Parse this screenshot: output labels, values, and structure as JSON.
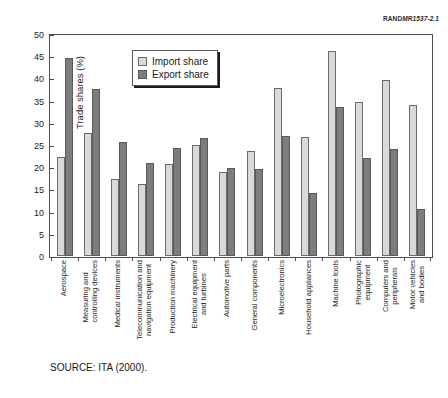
{
  "figure_number": {
    "brand": "RAND",
    "code": "MR1537-2.1"
  },
  "source_note": "SOURCE: ITA (2000).",
  "legend": {
    "position": "inside-top-left",
    "entries": [
      {
        "label": "Import share",
        "color": "#d9d9d9",
        "key": "import"
      },
      {
        "label": "Export share",
        "color": "#7d7d7d",
        "key": "export"
      }
    ]
  },
  "axis": {
    "y_title": "Trade shares (%)",
    "y_ticks": [
      0,
      5,
      10,
      15,
      20,
      25,
      30,
      35,
      40,
      45,
      50
    ]
  },
  "chart_data": {
    "type": "bar",
    "title": "",
    "subtitle": "",
    "xlabel": "",
    "ylabel": "Trade shares (%)",
    "ylim": [
      0,
      50
    ],
    "ytick_step": 5,
    "grid": false,
    "legend_position": "inside-top-left",
    "orientation": "vertical",
    "grouping": "grouped",
    "categories": [
      "Aerospace",
      "Measuring and controlling devices",
      "Medical instruments",
      "Telecommunication and navigation equipment",
      "Production machinery",
      "Electrical equipment and turbines",
      "Automotive parts",
      "General components",
      "Microelectronics",
      "Household appliances",
      "Machine tools",
      "Photographic equipment",
      "Computers and peripherals",
      "Motor vehicles and bodies"
    ],
    "category_lines": [
      [
        "Aerospace"
      ],
      [
        "Measuring and",
        "controlling devices"
      ],
      [
        "Medical instruments"
      ],
      [
        "Telecommunication and",
        "navigation equipment"
      ],
      [
        "Production machinery"
      ],
      [
        "Electrical equipment",
        "and turbines"
      ],
      [
        "Automotive parts"
      ],
      [
        "General components"
      ],
      [
        "Microelectronics"
      ],
      [
        "Household appliances"
      ],
      [
        "Machine tools"
      ],
      [
        "Photographic",
        "equipment"
      ],
      [
        "Computers and",
        "peripherals"
      ],
      [
        "Motor vehicles",
        "and bodies"
      ]
    ],
    "series": [
      {
        "name": "Import share",
        "color": "#d9d9d9",
        "values": [
          22.2,
          27.8,
          17.4,
          16.3,
          20.7,
          24.9,
          19.0,
          23.7,
          37.8,
          26.7,
          46.1,
          34.7,
          39.7,
          33.9
        ]
      },
      {
        "name": "Export share",
        "color": "#7d7d7d",
        "values": [
          44.5,
          37.7,
          25.7,
          20.9,
          24.3,
          26.6,
          19.8,
          19.6,
          27.0,
          14.1,
          33.5,
          22.0,
          24.2,
          10.6
        ]
      }
    ]
  }
}
